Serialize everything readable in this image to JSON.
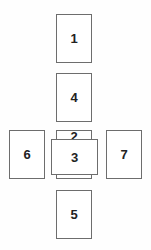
{
  "diagram": {
    "cards": [
      {
        "position": "1",
        "orientation": "vertical"
      },
      {
        "position": "2",
        "orientation": "vertical"
      },
      {
        "position": "3",
        "orientation": "horizontal"
      },
      {
        "position": "4",
        "orientation": "vertical"
      },
      {
        "position": "5",
        "orientation": "vertical"
      },
      {
        "position": "6",
        "orientation": "vertical"
      },
      {
        "position": "7",
        "orientation": "vertical"
      }
    ],
    "colors": {
      "border": "#6d6d6d",
      "card_fill": "#ffffff",
      "background": "#fefefe"
    }
  }
}
